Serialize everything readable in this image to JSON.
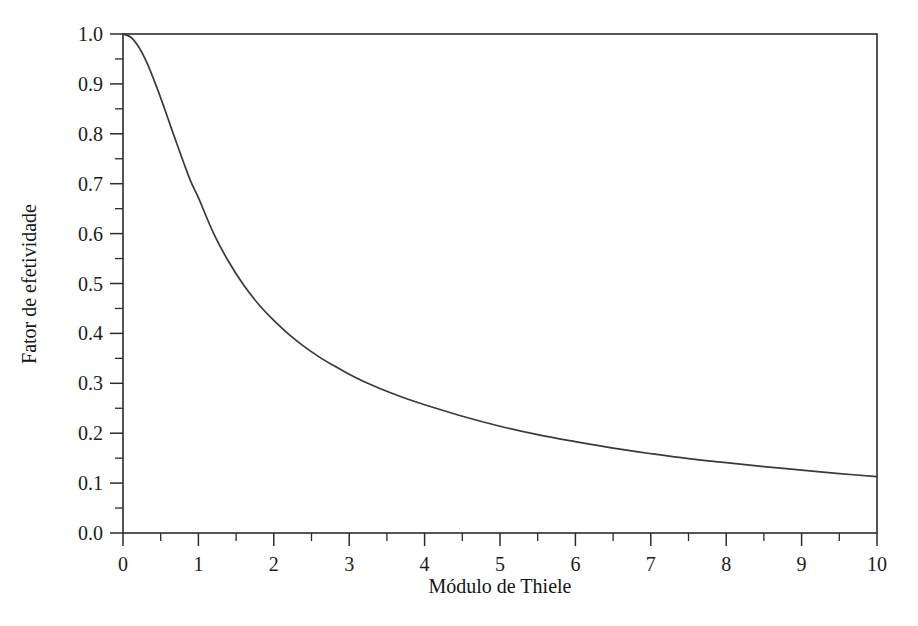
{
  "chart_data": {
    "type": "line",
    "title": "",
    "xlabel": "Módulo de Thiele",
    "ylabel": "Fator de efetividade",
    "xlim": [
      0,
      10
    ],
    "ylim": [
      0,
      1
    ],
    "grid": false,
    "legend": null,
    "x_ticks": [
      0,
      1,
      2,
      3,
      4,
      5,
      6,
      7,
      8,
      9,
      10
    ],
    "x_tick_labels": [
      "0",
      "1",
      "2",
      "3",
      "4",
      "5",
      "6",
      "7",
      "8",
      "9",
      "10"
    ],
    "x_minor_ticks": [
      0.5,
      1.5,
      2.5,
      3.5,
      4.5,
      5.5,
      6.5,
      7.5,
      8.5,
      9.5
    ],
    "y_ticks": [
      0.0,
      0.1,
      0.2,
      0.3,
      0.4,
      0.5,
      0.6,
      0.7,
      0.8,
      0.9,
      1.0
    ],
    "y_tick_labels": [
      "0.0",
      "0.1",
      "0.2",
      "0.3",
      "0.4",
      "0.5",
      "0.6",
      "0.7",
      "0.8",
      "0.9",
      "1.0"
    ],
    "y_minor_ticks": [
      0.05,
      0.15,
      0.25,
      0.35,
      0.45,
      0.55,
      0.65,
      0.75,
      0.85,
      0.95
    ],
    "line_color": "#3a3a3a",
    "series": [
      {
        "name": "Fator de efetividade (esfera)",
        "x": [
          0.0,
          0.1,
          0.2,
          0.3,
          0.4,
          0.5,
          0.6,
          0.7,
          0.8,
          0.9,
          1.0,
          1.2,
          1.4,
          1.6,
          1.8,
          2.0,
          2.2,
          2.4,
          2.6,
          2.8,
          3.0,
          3.2,
          3.4,
          3.6,
          3.8,
          4.0,
          4.5,
          5.0,
          5.5,
          6.0,
          6.5,
          7.0,
          7.5,
          8.0,
          8.5,
          9.0,
          9.5,
          10.0
        ],
        "y": [
          1.0,
          0.994,
          0.976,
          0.948,
          0.912,
          0.872,
          0.829,
          0.786,
          0.744,
          0.704,
          0.672,
          0.601,
          0.544,
          0.497,
          0.458,
          0.426,
          0.398,
          0.374,
          0.353,
          0.335,
          0.318,
          0.303,
          0.29,
          0.278,
          0.267,
          0.257,
          0.234,
          0.214,
          0.197,
          0.183,
          0.17,
          0.159,
          0.149,
          0.141,
          0.133,
          0.126,
          0.119,
          0.113
        ]
      }
    ]
  },
  "axes": {
    "y_axis_title": "Fator de efetividade",
    "x_axis_title": "Módulo de Thiele"
  },
  "caption": {
    "text": ""
  }
}
